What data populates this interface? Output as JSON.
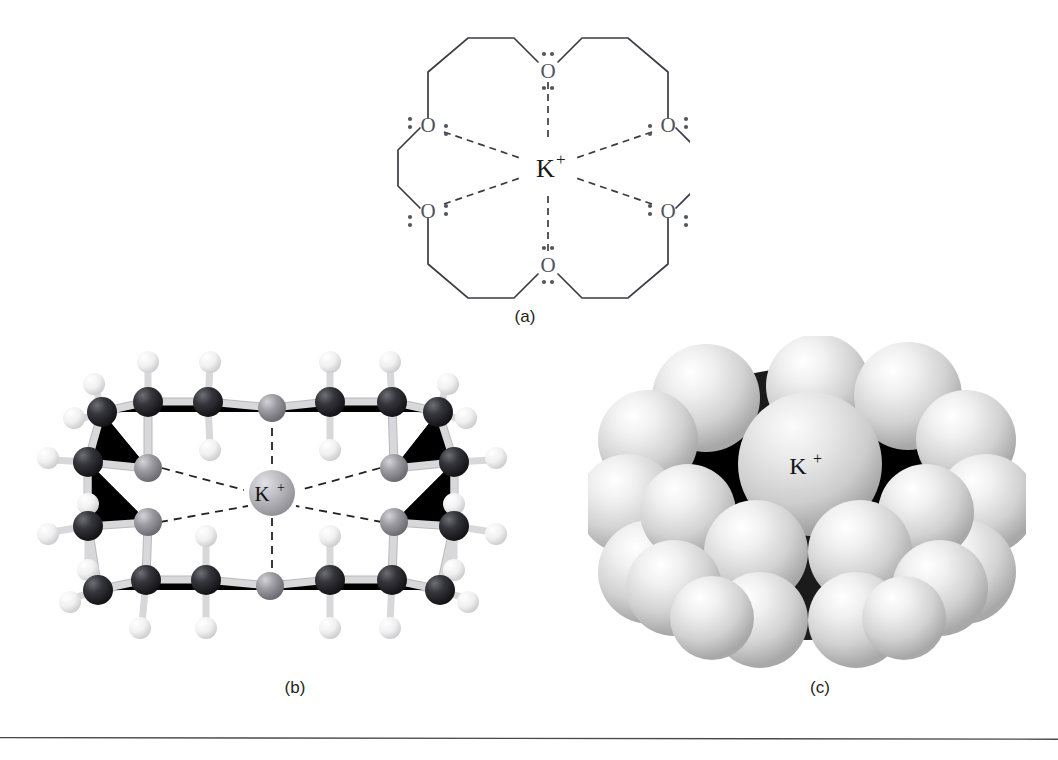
{
  "figure": {
    "background_color": "#ffffff",
    "panels": [
      {
        "id": "a",
        "caption": "(a)",
        "representation": "lewis-structure",
        "description": "Lewis structure of 18-crown-6 with six ether oxygens coordinating a potassium ion",
        "center_ion": "K",
        "center_charge": "+",
        "oxygen_label": "O",
        "oxygen_count": 6,
        "lone_pairs_per_oxygen": 2,
        "coordination_bonds": 6,
        "bond_style": "dashed",
        "colors": {
          "bond": "#3b3b47",
          "oxygen_text": "#51515c",
          "potassium_text": "#1a1a1a",
          "lone_pair_dot": "#55555f"
        }
      },
      {
        "id": "b",
        "caption": "(b)",
        "representation": "ball-and-stick",
        "description": "Ball-and-stick model of the 18-crown-6 potassium complex viewed edge-on",
        "center_ion": "K",
        "center_charge": "+",
        "atom_types": [
          {
            "element": "C",
            "name": "carbon",
            "color": "#2b2b30",
            "radius": 15
          },
          {
            "element": "O",
            "name": "oxygen",
            "color": "#8d8d93",
            "radius": 14
          },
          {
            "element": "H",
            "name": "hydrogen",
            "color": "#f2f2f2",
            "radius": 11
          },
          {
            "element": "K",
            "name": "potassium",
            "color": "#b6b6bb",
            "radius": 22
          }
        ],
        "carbon_count": 12,
        "oxygen_count": 6,
        "coordination_bonds": 6,
        "bond_color": "#d8d8da"
      },
      {
        "id": "c",
        "caption": "(c)",
        "representation": "space-filling",
        "description": "Space-filling model of the 18-crown-6 potassium complex",
        "center_ion": "K",
        "center_charge": "+",
        "sphere_color": "#e9e9e9",
        "shadow_color": "#1a1a1a",
        "highlight_color": "#ffffff"
      }
    ],
    "rule": {
      "present": true,
      "color": "#4a4a4a",
      "position": "bottom"
    }
  }
}
